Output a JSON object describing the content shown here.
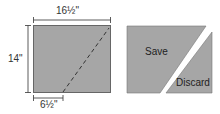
{
  "left_panel": {
    "width_label": "16½\"",
    "height_label": "14\"",
    "offset_label": "6½\""
  },
  "right_panel": {
    "save_label": "Save",
    "discard_label": "Discard"
  },
  "colors": {
    "fill": "#a6a6a6",
    "stroke": "#555555",
    "dim": "#333333"
  }
}
